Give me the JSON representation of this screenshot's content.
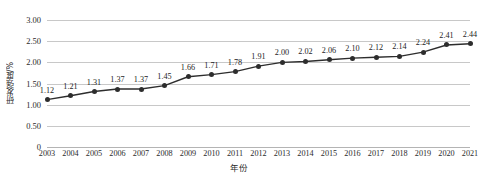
{
  "chart_data": {
    "type": "line",
    "title": "",
    "xlabel": "年份",
    "ylabel": "研发强度/%",
    "categories": [
      "2003",
      "2004",
      "2005",
      "2006",
      "2007",
      "2008",
      "2009",
      "2010",
      "2011",
      "2012",
      "2013",
      "2014",
      "2015",
      "2016",
      "2017",
      "2018",
      "2019",
      "2020",
      "2021"
    ],
    "values": [
      1.12,
      1.21,
      1.31,
      1.37,
      1.37,
      1.45,
      1.66,
      1.71,
      1.78,
      1.91,
      2.0,
      2.02,
      2.06,
      2.1,
      2.12,
      2.14,
      2.24,
      2.41,
      2.44
    ],
    "data_labels": [
      "1.12",
      "1.21",
      "1.31",
      "1.37",
      "1.37",
      "1.45",
      "1.66",
      "1.71",
      "1.78",
      "1.91",
      "2.00",
      "2.02",
      "2.06",
      "2.10",
      "2.12",
      "2.14",
      "2.24",
      "2.41",
      "2.44"
    ],
    "ylim": [
      0,
      3.0
    ],
    "y_ticks": [
      0,
      0.5,
      1.0,
      1.5,
      2.0,
      2.5,
      3.0
    ],
    "y_tick_labels": [
      "0",
      "0.50",
      "1.00",
      "1.50",
      "2.00",
      "2.50",
      "3.00"
    ],
    "grid": true,
    "legend": "none",
    "series_color": "#2d2d2d",
    "gridline_color": "#c8c8c8",
    "marker": "circle"
  },
  "axes": {
    "y_title": "研发强度/%",
    "x_title": "年份"
  }
}
